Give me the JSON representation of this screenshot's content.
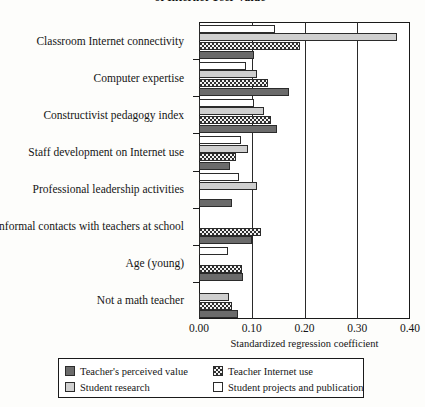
{
  "chart_data": {
    "type": "bar",
    "orientation": "horizontal",
    "title": "of Internet User Value",
    "xlabel": "Standardized regression coefficient",
    "ylabel": "",
    "xlim": [
      0.0,
      0.4
    ],
    "xticks": [
      "0.00",
      "0.10",
      "0.20",
      "0.30",
      "0.40"
    ],
    "xtick_values": [
      0.0,
      0.1,
      0.2,
      0.3,
      0.4
    ],
    "grid": true,
    "legend_position": "bottom",
    "categories": [
      "Classroom Internet connectivity",
      "Computer expertise",
      "Constructivist pedagogy index",
      "Staff development on Internet use",
      "Professional leadership activities",
      "Informal contacts with teachers at school",
      "Age (young)",
      "Not a math teacher"
    ],
    "series": [
      {
        "name": "Student projects and publication",
        "swatch": "white",
        "values": [
          0.145,
          0.09,
          0.105,
          0.08,
          0.075,
          null,
          0.055,
          null
        ]
      },
      {
        "name": "Student research",
        "swatch": "light-gray",
        "values": [
          0.375,
          0.11,
          0.123,
          0.093,
          0.11,
          null,
          null,
          0.057
        ]
      },
      {
        "name": "Teacher Internet use",
        "swatch": "dotted",
        "values": [
          0.192,
          0.13,
          0.137,
          0.07,
          null,
          0.118,
          0.082,
          0.062
        ]
      },
      {
        "name": "Teacher's perceived value",
        "swatch": "dark-gray",
        "values": [
          0.105,
          0.17,
          0.147,
          0.058,
          0.063,
          0.1,
          0.083,
          0.073
        ]
      }
    ]
  },
  "legend": {
    "entries": [
      {
        "label": "Teacher's perceived value",
        "swatch": "dark-gray"
      },
      {
        "label": "Teacher Internet use",
        "swatch": "dotted"
      },
      {
        "label": "Student research",
        "swatch": "light-gray"
      },
      {
        "label": "Student projects and publication",
        "swatch": "white"
      }
    ]
  },
  "colors": {
    "dark_gray": "#6b6b6b",
    "light_gray": "#cfcfcf",
    "white": "#ffffff",
    "dotted_base": "#f2f2f2",
    "outline": "#2b2b2b",
    "axis": "#1a1a1a"
  }
}
